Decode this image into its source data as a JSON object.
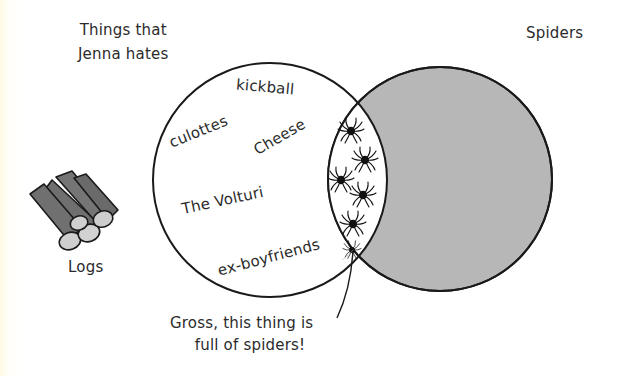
{
  "diagram": {
    "type": "venn",
    "sets": [
      {
        "id": "left",
        "title_lines": [
          "Things that",
          "Jenna hates"
        ],
        "fill": "#ffffff",
        "stroke": "#1a1a1a",
        "items": [
          "kickball",
          "culottes",
          "Cheese",
          "The Volturi",
          "ex-boyfriends"
        ]
      },
      {
        "id": "right",
        "title": "Spiders",
        "fill": "#b7b7b7",
        "stroke": "#1a1a1a",
        "items": []
      }
    ],
    "intersection": {
      "fill": "#ffffff",
      "spider_count": 5,
      "icon": "spider-icon"
    },
    "outside": {
      "label": "Logs",
      "icon": "logs-icon"
    },
    "callout": {
      "lines": [
        "Gross, this thing is",
        "full of spiders!"
      ],
      "points_to": "intersection-bottom"
    }
  },
  "colors": {
    "background": "#ffffff",
    "edge_tint": "#fdfbe3",
    "ink": "#1a1a1a",
    "right_fill": "#b7b7b7",
    "log_bark": "#6f6f6f",
    "log_end": "#cfcfcf"
  }
}
